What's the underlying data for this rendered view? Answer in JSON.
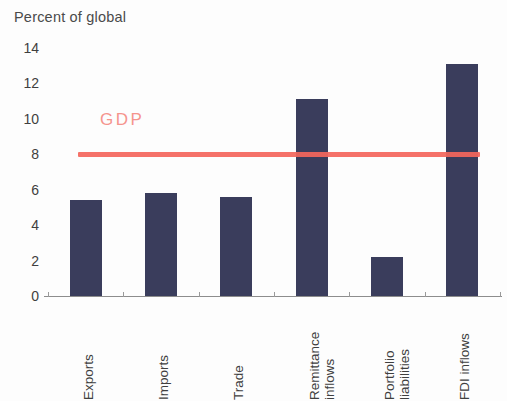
{
  "chart_data": {
    "type": "bar",
    "title": "Percent of global",
    "xlabel": "",
    "ylabel": "",
    "ylim": [
      0,
      14
    ],
    "ytick_step": 2,
    "yticks": [
      14,
      12,
      10,
      8,
      6,
      4,
      2,
      0
    ],
    "grid": false,
    "legend": "none",
    "categories": [
      "Exports",
      "Imports",
      "Trade",
      "Remittance inflows",
      "Portfolio liabilities",
      "FDI inflows"
    ],
    "category_lines": [
      [
        "Exports"
      ],
      [
        "Imports"
      ],
      [
        "Trade"
      ],
      [
        "Remittance",
        "inflows"
      ],
      [
        "Portfolio",
        "liabilities"
      ],
      [
        "FDI inflows"
      ]
    ],
    "values": [
      5.4,
      5.8,
      5.6,
      11.1,
      2.2,
      13.1
    ],
    "bar_color": "#3a3d5c",
    "annotations": [
      {
        "name": "gdp-reference-line",
        "label": "GDP",
        "value": 8,
        "color": "#f4665c",
        "label_color": "#f5948d",
        "orientation": "horizontal"
      }
    ]
  }
}
